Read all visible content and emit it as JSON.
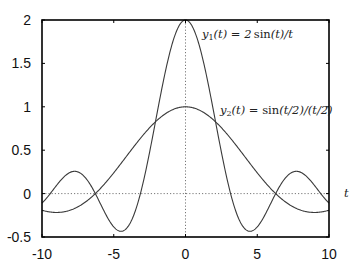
{
  "chart_data": {
    "type": "line",
    "title": "",
    "xlabel": "t",
    "ylabel": "",
    "xlim": [
      -10,
      10
    ],
    "ylim": [
      -0.5,
      2
    ],
    "grid": false,
    "zero_lines": {
      "x": 0,
      "y": 0,
      "style": "dotted"
    },
    "x_ticks": [
      -10,
      -5,
      0,
      5,
      10
    ],
    "x_tick_labels": [
      "-10",
      "-5",
      "0",
      "5",
      "10"
    ],
    "y_ticks": [
      -0.5,
      0,
      0.5,
      1,
      1.5,
      2
    ],
    "y_tick_labels": [
      "-0.5",
      "0",
      "0.5",
      "1",
      "1.5",
      "2"
    ],
    "legend": "inline annotations",
    "series": [
      {
        "name": "y1(t) = 2 sin(t)/t",
        "formula": "2*sin(t)/t",
        "x": [
          -10,
          -9,
          -8,
          -7,
          -6,
          -5,
          -4,
          -3,
          -2,
          -1,
          0,
          1,
          2,
          3,
          4,
          5,
          6,
          7,
          8,
          9,
          10
        ],
        "values": [
          -0.109,
          0.092,
          0.247,
          0.188,
          -0.093,
          -0.384,
          -0.378,
          0.094,
          0.909,
          1.683,
          2.0,
          1.683,
          0.909,
          0.094,
          -0.378,
          -0.384,
          -0.093,
          0.188,
          0.247,
          0.092,
          -0.109
        ]
      },
      {
        "name": "y2(t) = sin(t/2)/(t/2)",
        "formula": "sin(t/2)/(t/2)",
        "x": [
          -10,
          -9,
          -8,
          -7,
          -6,
          -5,
          -4,
          -3,
          -2,
          -1,
          0,
          1,
          2,
          3,
          4,
          5,
          6,
          7,
          8,
          9,
          10
        ],
        "values": [
          -0.192,
          -0.217,
          -0.189,
          -0.1,
          0.047,
          0.239,
          0.455,
          0.665,
          0.841,
          0.959,
          1.0,
          0.959,
          0.841,
          0.665,
          0.455,
          0.239,
          0.047,
          -0.1,
          -0.189,
          -0.217,
          -0.192
        ]
      }
    ],
    "annotations": [
      {
        "series": 0,
        "text_parts": [
          "y",
          "1",
          "(t) = 2 ",
          "sin",
          "(t)/t"
        ],
        "x_px": 202,
        "y_px": 37
      },
      {
        "series": 1,
        "text_parts": [
          "y",
          "2",
          "(t) = ",
          "sin",
          "(t/2)/(t/2)"
        ],
        "x_px": 220,
        "y_px": 113
      }
    ]
  },
  "labels": {
    "y1": {
      "var": "y",
      "sub": "1",
      "mid": "(t) = 2 ",
      "fn": "sin",
      "tail": "(t)/t"
    },
    "y2": {
      "var": "y",
      "sub": "2",
      "mid": "(t) = ",
      "fn": "sin",
      "tail": "(t/2)/(t/2)"
    },
    "xaxis": "t"
  },
  "style": {
    "curve_color": "#3a3a3a",
    "frame_color": "#000000",
    "zero_line_color": "#555555"
  }
}
